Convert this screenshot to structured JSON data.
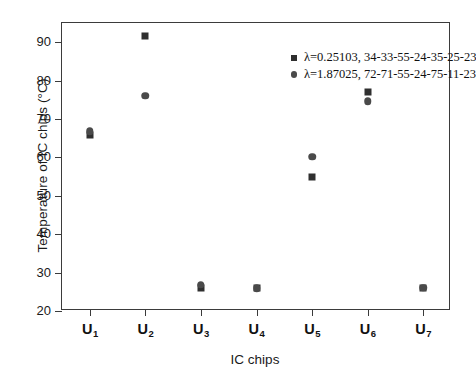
{
  "chart_data": {
    "type": "scatter",
    "title": "",
    "xlabel": "IC chips",
    "ylabel": "Temperature of IC chips (°C)",
    "categories": [
      "U₁",
      "U₂",
      "U₃",
      "U₄",
      "U₅",
      "U₆",
      "U₇"
    ],
    "category_labels": [
      {
        "base": "U",
        "sub": "1"
      },
      {
        "base": "U",
        "sub": "2"
      },
      {
        "base": "U",
        "sub": "3"
      },
      {
        "base": "U",
        "sub": "4"
      },
      {
        "base": "U",
        "sub": "5"
      },
      {
        "base": "U",
        "sub": "6"
      },
      {
        "base": "U",
        "sub": "7"
      }
    ],
    "ylim": [
      20,
      95
    ],
    "yticks": [
      20,
      30,
      40,
      50,
      60,
      70,
      80,
      90
    ],
    "ytick_labels": [
      "20",
      "30",
      "40",
      "50",
      "60",
      "70",
      "80",
      "90"
    ],
    "grid": false,
    "legend_position": "top-right-inside",
    "series": [
      {
        "name": "λ=0.25103, 34-33-55-24-35-25-23",
        "marker": "square",
        "color": "#2f2f2f",
        "values": [
          65.8,
          91.5,
          26.1,
          25.9,
          55.0,
          77.1,
          26.1
        ]
      },
      {
        "name": "λ=1.87025, 72-71-55-24-75-11-23",
        "marker": "circle",
        "color": "#4a4a4a",
        "values": [
          66.8,
          76.1,
          26.9,
          25.9,
          60.2,
          74.6,
          26.1
        ]
      }
    ]
  },
  "legend": {
    "items": [
      {
        "label": "λ=0.25103, 34-33-55-24-35-25-23",
        "marker": "square"
      },
      {
        "label": "λ=1.87025, 72-71-55-24-75-11-23",
        "marker": "circle"
      }
    ]
  }
}
